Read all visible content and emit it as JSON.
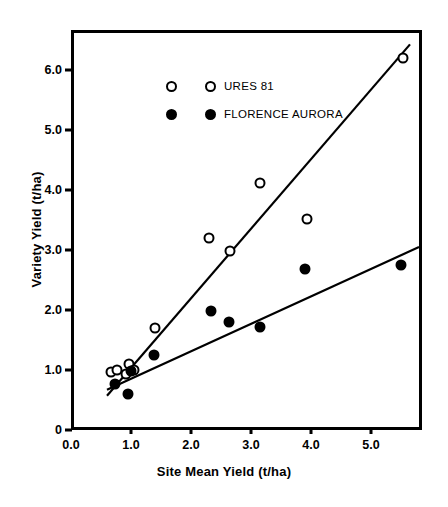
{
  "chart_data": {
    "type": "scatter",
    "title": "",
    "xlabel": "Site Mean Yield (t/ha)",
    "ylabel": "Variety Yield (t/ha)",
    "xlim": [
      0.0,
      5.85
    ],
    "ylim": [
      0.0,
      6.67
    ],
    "grid": false,
    "legend_position": "top-left",
    "xticks": [
      "0.0",
      "1.0",
      "2.0",
      "3.0",
      "4.0",
      "5.0"
    ],
    "xtick_values": [
      0.0,
      1.0,
      2.0,
      3.0,
      4.0,
      5.0
    ],
    "yticks": [
      "0",
      "1.0",
      "2.0",
      "3.0",
      "4.0",
      "5.0",
      "6.0"
    ],
    "ytick_values": [
      0.0,
      1.0,
      2.0,
      3.0,
      4.0,
      5.0,
      6.0
    ],
    "series": [
      {
        "name": "URES 81",
        "marker": "open-circle",
        "color": "#000000",
        "points": [
          [
            0.62,
            1.02
          ],
          [
            0.72,
            1.05
          ],
          [
            0.86,
            0.98
          ],
          [
            0.92,
            1.15
          ],
          [
            1.0,
            1.05
          ],
          [
            1.35,
            1.75
          ],
          [
            2.25,
            3.25
          ],
          [
            2.6,
            3.03
          ],
          [
            3.1,
            4.17
          ],
          [
            3.88,
            3.57
          ],
          [
            5.48,
            6.25
          ]
        ],
        "fit_line": {
          "x0": 0.55,
          "y0": 0.62,
          "x1": 5.6,
          "y1": 6.48
        }
      },
      {
        "name": "FLORENCE AURORA",
        "marker": "filled-circle",
        "color": "#000000",
        "points": [
          [
            0.68,
            0.82
          ],
          [
            0.9,
            0.65
          ],
          [
            0.95,
            1.03
          ],
          [
            1.33,
            1.3
          ],
          [
            2.28,
            2.03
          ],
          [
            2.58,
            1.85
          ],
          [
            3.1,
            1.77
          ],
          [
            3.85,
            2.73
          ],
          [
            5.45,
            2.8
          ]
        ],
        "fit_line": {
          "x0": 0.55,
          "y0": 0.72,
          "x1": 5.75,
          "y1": 3.1
        }
      }
    ]
  },
  "legend": {
    "entries": [
      {
        "label": "URES 81",
        "marker": "open-circle"
      },
      {
        "label": "FLORENCE AURORA",
        "marker": "filled-circle"
      }
    ]
  },
  "axes": {
    "x_title": "Site Mean Yield (t/ha)",
    "y_title": "Variety Yield (t/ha)"
  }
}
